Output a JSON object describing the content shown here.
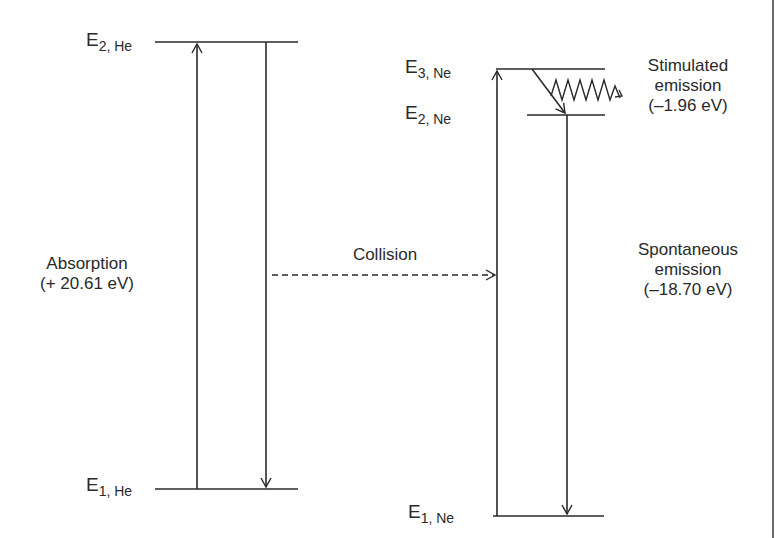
{
  "diagram": {
    "levels": {
      "he_e2": {
        "main": "E",
        "sub": "2, He"
      },
      "he_e1": {
        "main": "E",
        "sub": "1, He"
      },
      "ne_e3": {
        "main": "E",
        "sub": "3, Ne"
      },
      "ne_e2": {
        "main": "E",
        "sub": "2, Ne"
      },
      "ne_e1": {
        "main": "E",
        "sub": "1, Ne"
      }
    },
    "labels": {
      "absorption": {
        "line1": "Absorption",
        "line2": "(+ 20.61 eV)"
      },
      "collision": "Collision",
      "stimulated": {
        "line1": "Stimulated",
        "line2": "emission",
        "line3": "(–1.96 eV)"
      },
      "spontaneous": {
        "line1": "Spontaneous",
        "line2": "emission",
        "line3": "(–18.70 eV)"
      }
    },
    "colors": {
      "line": "#2a2a2a",
      "background": "#ffffff"
    }
  }
}
